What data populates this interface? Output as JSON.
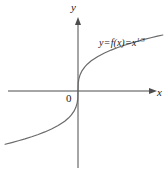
{
  "figure": {
    "background_color": "#ffffff",
    "curve_color": "#6a6a6a",
    "axis_color": "#4d4d4d",
    "text_color": "#1a1a1a"
  },
  "labels": {
    "y_axis": "y",
    "x_axis": "x",
    "origin": "0",
    "function_lhs": "y",
    "function_eq1": "=",
    "function_fx": "f(x)",
    "function_eq2": "=",
    "function_base": "x",
    "function_exponent": "1/3",
    "function_full": "y = f(x) = x^(1/3)"
  },
  "chart_data": {
    "type": "line",
    "title": "",
    "subtitle": "",
    "xlabel": "x",
    "ylabel": "y",
    "legend": [
      "y = f(x) = x^(1/3)"
    ],
    "legend_position": "inline-right",
    "grid": false,
    "annotations": [
      {
        "text": "0",
        "x": 0,
        "y": 0,
        "note": "origin label, placed below-left of origin"
      },
      {
        "text": "y = f(x) = x^(1/3)",
        "x": 1.6,
        "y": 1.35,
        "note": "curve equation label"
      }
    ],
    "axes": {
      "x_axis_drawn": true,
      "y_axis_drawn": true,
      "x_arrow": "right",
      "y_arrow": "up",
      "xlim": [
        -2.9,
        2.9
      ],
      "ylim": [
        -1.95,
        1.95
      ],
      "origin_px": [
        78,
        91
      ],
      "x_scale_px_per_unit": 26.5,
      "y_scale_px_per_unit": 38.0,
      "ticks": [],
      "tick_labels": []
    },
    "series": [
      {
        "name": "y = f(x) = x^(1/3)",
        "formula": "y = x^(1/3)",
        "color": "#6a6a6a",
        "linewidth": 1.2,
        "x": [
          -2.75,
          -2.5,
          -2.25,
          -2.0,
          -1.75,
          -1.5,
          -1.25,
          -1.0,
          -0.75,
          -0.5,
          -0.35,
          -0.25,
          -0.15,
          -0.08,
          -0.03,
          -0.008,
          0,
          0.008,
          0.03,
          0.08,
          0.15,
          0.25,
          0.35,
          0.5,
          0.75,
          1.0,
          1.25,
          1.5,
          1.75,
          2.0,
          2.25,
          2.5,
          2.75,
          3.0,
          3.2
        ],
        "y": [
          -1.402,
          -1.357,
          -1.31,
          -1.26,
          -1.205,
          -1.145,
          -1.077,
          -1.0,
          -0.909,
          -0.794,
          -0.705,
          -0.63,
          -0.531,
          -0.43,
          -0.311,
          -0.2,
          0,
          0.2,
          0.311,
          0.43,
          0.531,
          0.63,
          0.705,
          0.794,
          0.909,
          1.0,
          1.077,
          1.145,
          1.205,
          1.26,
          1.31,
          1.357,
          1.402,
          1.442,
          1.474
        ]
      }
    ]
  }
}
